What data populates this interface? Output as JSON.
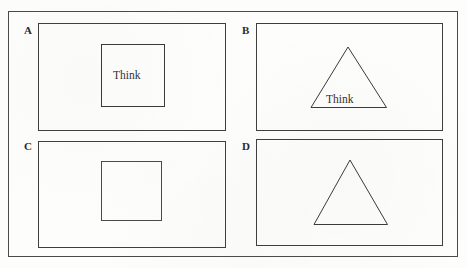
{
  "figure": {
    "stroke_color": "#4a4a4a",
    "background_color": "#fdfdfc",
    "text_color": "#333333",
    "label_color": "#2a2a2a",
    "outer_frame": {
      "x": 8,
      "y": 11,
      "width": 450,
      "height": 246
    },
    "panels": [
      {
        "id": "A",
        "label": "A",
        "label_x": 24,
        "label_y": 25,
        "box": {
          "x": 38,
          "y": 23,
          "width": 188,
          "height": 108
        },
        "shape": "square",
        "square": {
          "x": 101,
          "y": 44,
          "width": 64,
          "height": 63
        },
        "text": "Think",
        "text_x": 113,
        "text_y": 70
      },
      {
        "id": "B",
        "label": "B",
        "label_x": 242,
        "label_y": 25,
        "box": {
          "x": 256,
          "y": 23,
          "width": 187,
          "height": 108
        },
        "shape": "triangle",
        "triangle": {
          "apex_x": 348,
          "apex_y": 47,
          "left_x": 311,
          "right_x": 386,
          "base_y": 107
        },
        "text": "Think",
        "text_x": 326,
        "text_y": 94
      },
      {
        "id": "C",
        "label": "C",
        "label_x": 24,
        "label_y": 141,
        "box": {
          "x": 38,
          "y": 141,
          "width": 188,
          "height": 107
        },
        "shape": "square",
        "square": {
          "x": 101,
          "y": 161,
          "width": 61,
          "height": 60
        },
        "text": "",
        "text_x": 0,
        "text_y": 0
      },
      {
        "id": "D",
        "label": "D",
        "label_x": 242,
        "label_y": 141,
        "box": {
          "x": 256,
          "y": 139,
          "width": 187,
          "height": 107
        },
        "shape": "triangle",
        "triangle": {
          "apex_x": 350,
          "apex_y": 160,
          "left_x": 314,
          "right_x": 387,
          "base_y": 224
        },
        "text": "",
        "text_x": 0,
        "text_y": 0
      }
    ]
  }
}
